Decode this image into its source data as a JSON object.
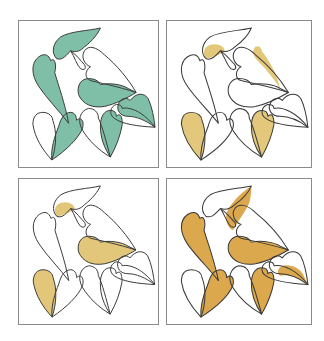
{
  "figure": {
    "outline_color": "#3a3a3a",
    "frame_color": "#8a8a8a"
  },
  "panels": [
    {
      "id": "top-left",
      "fill_color": "#80bfa7",
      "filled": [
        "A",
        "B",
        "C",
        "D",
        "E",
        "F"
      ]
    },
    {
      "id": "top-right",
      "fill_color": "#e3c87c",
      "filled": [
        "A_lobe",
        "G",
        "H",
        "F"
      ]
    },
    {
      "id": "bottom-left",
      "fill_color": "#e2c679",
      "filled": [
        "A_lobe",
        "C",
        "H"
      ]
    },
    {
      "id": "bottom-right",
      "fill_color": "#dba84d",
      "filled": [
        "A_right",
        "B",
        "C",
        "E",
        "F",
        "D_low"
      ]
    }
  ]
}
